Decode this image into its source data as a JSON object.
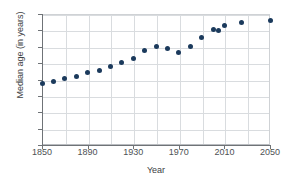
{
  "chart_data": {
    "type": "scatter",
    "title": "",
    "xlabel": "Year",
    "ylabel": "Median age (in years)",
    "xlim": [
      1850,
      2050
    ],
    "ylim": [
      0,
      40
    ],
    "xticks": [
      1850,
      1890,
      1930,
      1970,
      2010,
      2050
    ],
    "xtick_labels": [
      "1850",
      "1890",
      "1930",
      "1970",
      "2010",
      "2050"
    ],
    "x_minor_step": 20,
    "yticks": [
      0,
      5,
      10,
      15,
      20,
      25,
      30,
      35,
      40
    ],
    "ytick_labels": [
      "0",
      "5",
      "10",
      "15",
      "20",
      "25",
      "30",
      "35",
      "40"
    ],
    "grid": true,
    "legend": null,
    "marker_color": "#1b3a5c",
    "grid_color": "#d9dcdf",
    "axis_color": "#6f7377",
    "background": "#ffffff",
    "x": [
      1850,
      1860,
      1870,
      1880,
      1890,
      1900,
      1910,
      1920,
      1930,
      1940,
      1950,
      1960,
      1970,
      1980,
      1990,
      2000,
      2005,
      2010,
      2025,
      2050
    ],
    "y": [
      18.9,
      19.4,
      20.2,
      20.9,
      22.0,
      22.9,
      24.1,
      25.3,
      26.4,
      28.9,
      30.2,
      29.5,
      28.1,
      30.0,
      32.8,
      35.3,
      34.9,
      36.4,
      37.5,
      38.1
    ],
    "values": [
      {
        "year": 1850,
        "median_age": 18.9
      },
      {
        "year": 1860,
        "median_age": 19.4
      },
      {
        "year": 1870,
        "median_age": 20.2
      },
      {
        "year": 1880,
        "median_age": 20.9
      },
      {
        "year": 1890,
        "median_age": 22.0
      },
      {
        "year": 1900,
        "median_age": 22.9
      },
      {
        "year": 1910,
        "median_age": 24.1
      },
      {
        "year": 1920,
        "median_age": 25.3
      },
      {
        "year": 1930,
        "median_age": 26.4
      },
      {
        "year": 1940,
        "median_age": 28.9
      },
      {
        "year": 1950,
        "median_age": 30.2
      },
      {
        "year": 1960,
        "median_age": 29.5
      },
      {
        "year": 1970,
        "median_age": 28.1
      },
      {
        "year": 1980,
        "median_age": 30.0
      },
      {
        "year": 1990,
        "median_age": 32.8
      },
      {
        "year": 2000,
        "median_age": 35.3
      },
      {
        "year": 2005,
        "median_age": 34.9
      },
      {
        "year": 2010,
        "median_age": 36.4
      },
      {
        "year": 2025,
        "median_age": 37.5
      },
      {
        "year": 2050,
        "median_age": 38.1
      }
    ]
  }
}
